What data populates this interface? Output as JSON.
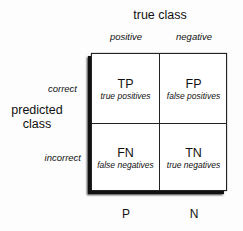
{
  "title": "true class",
  "columns": [
    {
      "label": "positive",
      "footer": "P"
    },
    {
      "label": "negative",
      "footer": "N"
    }
  ],
  "rows": [
    {
      "label": "correct"
    },
    {
      "label": "incorrect"
    }
  ],
  "row_axis_label": {
    "line1": "predicted",
    "line2": "class"
  },
  "cells": [
    [
      {
        "abbr": "TP",
        "text": "true positives"
      },
      {
        "abbr": "FP",
        "text": "false positives"
      }
    ],
    [
      {
        "abbr": "FN",
        "text": "false negatives"
      },
      {
        "abbr": "TN",
        "text": "true negatives"
      }
    ]
  ]
}
